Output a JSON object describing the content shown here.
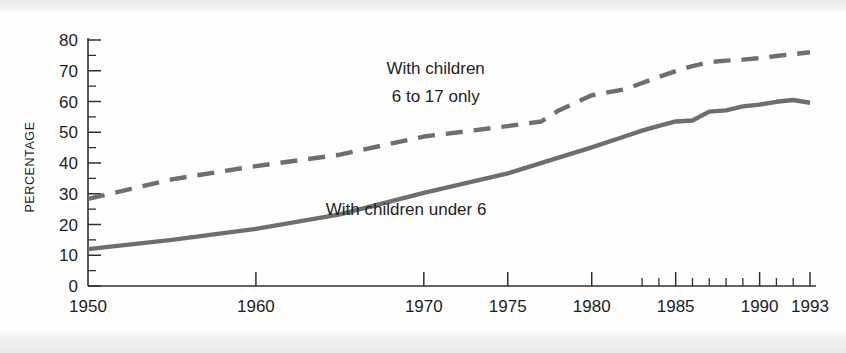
{
  "chart_data": {
    "type": "line",
    "title": "",
    "xlabel": "",
    "ylabel": "PERCENTAGE",
    "xlim": [
      1950,
      1993
    ],
    "ylim": [
      0,
      80
    ],
    "grid": false,
    "legend_position": "inline-annotations",
    "x_tick_labels": [
      "1950",
      "1960",
      "1970",
      "1975",
      "1980",
      "1985",
      "1990",
      "1993"
    ],
    "x_tick_values": [
      1950,
      1960,
      1970,
      1975,
      1980,
      1985,
      1990,
      1993
    ],
    "x_minor_ticks": [
      1983,
      1984,
      1986,
      1987,
      1988,
      1989,
      1991,
      1992
    ],
    "y_tick_labels": [
      "0",
      "10",
      "20",
      "30",
      "40",
      "50",
      "60",
      "70",
      "80"
    ],
    "y_tick_values": [
      0,
      10,
      20,
      30,
      40,
      50,
      60,
      70,
      80
    ],
    "y_minor_ticks": [
      5,
      15,
      25,
      35,
      45,
      55,
      65,
      75
    ],
    "series": [
      {
        "name": "With children 6 to 17 only",
        "style": "dashed",
        "color": "#6e6e6e",
        "annotation": "With children\n6 to 17 only",
        "x": [
          1950,
          1955,
          1960,
          1965,
          1970,
          1975,
          1977,
          1978,
          1980,
          1982,
          1983,
          1984,
          1985,
          1986,
          1987,
          1988,
          1989,
          1990,
          1991,
          1992,
          1993
        ],
        "values": [
          28.3,
          34.7,
          39.0,
          42.7,
          48.6,
          52.0,
          53.5,
          57.0,
          62.0,
          64.0,
          66.0,
          68.0,
          69.9,
          71.5,
          72.8,
          73.3,
          73.6,
          74.1,
          74.8,
          75.4,
          76.0
        ]
      },
      {
        "name": "With children under 6",
        "style": "solid",
        "color": "#6e6e6e",
        "annotation": "With children under 6",
        "x": [
          1950,
          1955,
          1960,
          1965,
          1970,
          1975,
          1980,
          1982,
          1983,
          1984,
          1985,
          1986,
          1987,
          1988,
          1989,
          1990,
          1991,
          1992,
          1993
        ],
        "values": [
          12.0,
          15.0,
          18.6,
          23.3,
          30.3,
          36.6,
          45.1,
          48.7,
          50.5,
          52.1,
          53.5,
          53.8,
          56.7,
          57.1,
          58.4,
          59.0,
          59.9,
          60.5,
          59.6
        ]
      }
    ],
    "annotations": [
      {
        "name": "dashed-series-label-line1",
        "text": "With children",
        "x_pct": 51.5,
        "y_pct": 21.0
      },
      {
        "name": "dashed-series-label-line2",
        "text": "6 to 17 only",
        "x_pct": 51.5,
        "y_pct": 29.0
      },
      {
        "name": "solid-series-label",
        "text": "With children under 6",
        "x_pct": 48.0,
        "y_pct": 61.0
      }
    ]
  },
  "axis": {
    "y_title": "PERCENTAGE"
  },
  "labels": {
    "y": [
      "80",
      "70",
      "60",
      "50",
      "40",
      "30",
      "20",
      "10",
      "0"
    ],
    "x": [
      "1950",
      "1960",
      "1970",
      "1975",
      "1980",
      "1985",
      "1990",
      "1993"
    ]
  },
  "annot": {
    "dashed_line1": "With children",
    "dashed_line2": "6 to 17 only",
    "solid": "With children under 6"
  },
  "colors": {
    "line": "#6e6e6e",
    "axis": "#2f2f2f",
    "text": "#1d1d1d",
    "page": "#ffffff"
  }
}
